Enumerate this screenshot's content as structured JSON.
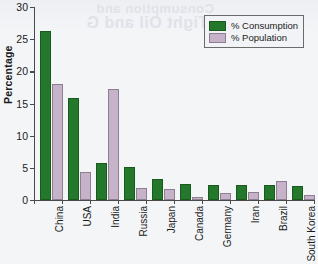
{
  "figure": {
    "background_color": "#f4f5f7",
    "bleed_through_text_1": "Consumption and",
    "bleed_through_text_2": "Tight Oil and G"
  },
  "chart_data": {
    "type": "bar",
    "title": "",
    "xlabel": "",
    "ylabel": "Percentage",
    "ylim": [
      0,
      30
    ],
    "yticks": [
      0,
      5,
      10,
      15,
      20,
      25,
      30
    ],
    "ytick_labels": [
      "0",
      "5",
      "10",
      "15",
      "20",
      "25",
      "30"
    ],
    "grid": false,
    "legend_position": "top-right",
    "categories": [
      "China",
      "USA",
      "India",
      "Russia",
      "Japan",
      "Canada",
      "Germany",
      "Iran",
      "Brazil",
      "South Korea"
    ],
    "series": [
      {
        "name": "% Consumption",
        "color": "#23782b",
        "values": [
          26.2,
          15.8,
          5.8,
          5.2,
          3.2,
          2.5,
          2.3,
          2.3,
          2.3,
          2.2
        ]
      },
      {
        "name": "% Population",
        "color": "#c6b2c9",
        "values": [
          18.0,
          4.4,
          17.3,
          1.9,
          1.7,
          0.5,
          1.1,
          1.2,
          2.9,
          0.75
        ]
      }
    ]
  }
}
